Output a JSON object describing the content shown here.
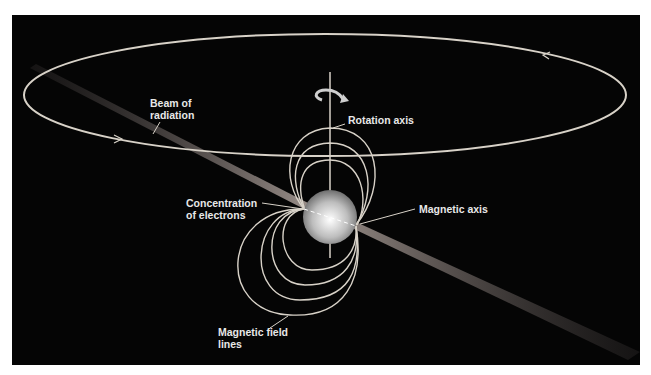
{
  "diagram": {
    "labels": {
      "beam": [
        "Beam of",
        "radiation"
      ],
      "rotation_axis": "Rotation axis",
      "concentration": [
        "Concentration",
        "of electrons"
      ],
      "magnetic_axis": "Magnetic axis",
      "field_lines": [
        "Magnetic field",
        "lines"
      ]
    },
    "icons": {
      "rotation": "curved-arrow-icon",
      "orbit_arrow": "arrowhead-icon"
    },
    "colors": {
      "background": "#050505",
      "lines": "#d8d2c8",
      "beam": "#8a7f7a",
      "text": "#e8e8e8",
      "star": "#cfcfcf"
    }
  }
}
